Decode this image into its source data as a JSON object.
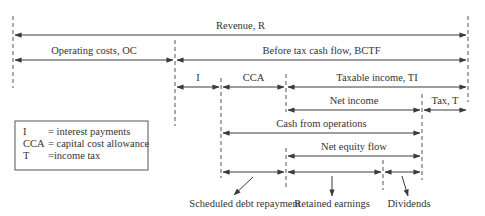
{
  "diagram": {
    "colors": {
      "line": "#3a3a3a",
      "dash": "#555555",
      "text": "#333333",
      "background": "#ffffff"
    },
    "dividers": [
      {
        "name": "divider-left",
        "x": 13,
        "y1": 16,
        "y2": 88
      },
      {
        "name": "divider-right",
        "x": 468,
        "y1": 16,
        "y2": 102
      },
      {
        "name": "divider-oc-bctf",
        "x": 175,
        "y1": 40,
        "y2": 126
      },
      {
        "name": "divider-i-cca",
        "x": 221,
        "y1": 78,
        "y2": 178
      },
      {
        "name": "divider-cca-ti",
        "x": 286,
        "y1": 74,
        "y2": 112
      },
      {
        "name": "divider-debt-equity",
        "x": 286,
        "y1": 148,
        "y2": 190
      },
      {
        "name": "divider-ni-tax",
        "x": 422,
        "y1": 94,
        "y2": 180
      },
      {
        "name": "divider-retained-dividends",
        "x": 383,
        "y1": 160,
        "y2": 190
      }
    ],
    "spans": [
      {
        "name": "span-revenue",
        "label": "Revenue, R",
        "x1": 13,
        "x2": 468,
        "y": 35,
        "ly": 29
      },
      {
        "name": "span-operating-costs",
        "label": "Operating costs, OC",
        "x1": 13,
        "x2": 175,
        "y": 60,
        "ly": 54
      },
      {
        "name": "span-bctf",
        "label": "Before tax cash flow, BCTF",
        "x1": 175,
        "x2": 468,
        "y": 60,
        "ly": 54
      },
      {
        "name": "span-interest",
        "label": "I",
        "x1": 175,
        "x2": 221,
        "y": 87,
        "ly": 81
      },
      {
        "name": "span-cca",
        "label": "CCA",
        "x1": 221,
        "x2": 286,
        "y": 87,
        "ly": 81
      },
      {
        "name": "span-taxable-income",
        "label": "Taxable income, TI",
        "x1": 286,
        "x2": 468,
        "y": 87,
        "ly": 81
      },
      {
        "name": "span-net-income",
        "label": "Net income",
        "x1": 286,
        "x2": 422,
        "y": 110,
        "ly": 104
      },
      {
        "name": "span-tax",
        "label": "Tax, T",
        "x1": 422,
        "x2": 468,
        "y": 110,
        "ly": 104
      },
      {
        "name": "span-cash-from-operations",
        "label": "Cash from operations",
        "x1": 221,
        "x2": 422,
        "y": 133,
        "ly": 127
      },
      {
        "name": "span-net-equity-flow",
        "label": "Net equity flow",
        "x1": 286,
        "x2": 422,
        "y": 156,
        "ly": 150
      },
      {
        "name": "span-debt-repayment",
        "label": "",
        "x1": 221,
        "x2": 286,
        "y": 172,
        "ly": 0
      },
      {
        "name": "span-retained-earnings",
        "label": "",
        "x1": 286,
        "x2": 383,
        "y": 172,
        "ly": 0
      },
      {
        "name": "span-dividends",
        "label": "",
        "x1": 383,
        "x2": 422,
        "y": 172,
        "ly": 0
      }
    ],
    "callouts": [
      {
        "name": "callout-scheduled-debt-repayment",
        "label": "Scheduled debt repayment",
        "ax1": 253,
        "ay1": 177,
        "ax2": 234,
        "ay2": 195,
        "tx": 245,
        "ty": 207
      },
      {
        "name": "callout-retained-earnings",
        "label": "Retained earnings",
        "ax1": 332,
        "ay1": 176,
        "ax2": 332,
        "ay2": 196,
        "tx": 332,
        "ty": 207
      },
      {
        "name": "callout-dividends",
        "label": "Dividends",
        "ax1": 402,
        "ay1": 176,
        "ax2": 408,
        "ay2": 196,
        "tx": 409,
        "ty": 207
      }
    ],
    "legend": {
      "box": {
        "x": 15,
        "y": 121,
        "w": 133,
        "h": 49
      },
      "entries": [
        {
          "abbr": "I",
          "definition": "= interest payments"
        },
        {
          "abbr": "CCA",
          "definition": "= capital cost allowance"
        },
        {
          "abbr": "T",
          "definition": "=income tax"
        }
      ]
    }
  }
}
